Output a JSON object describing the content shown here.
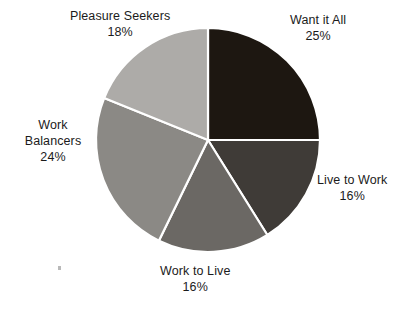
{
  "chart_data": {
    "type": "pie",
    "title": "",
    "subtitle": "",
    "xlabel": "",
    "ylabel": "",
    "legend_position": "labels-around-pie",
    "grid": false,
    "start_angle_deg": 0,
    "direction": "clockwise",
    "categories": [
      "Want it All",
      "Live to Work",
      "Work to Live",
      "Work Balancers",
      "Pleasure Seekers"
    ],
    "values": [
      25,
      16,
      16,
      24,
      18
    ],
    "value_suffix": "%",
    "colors": [
      "#1d1711",
      "#3f3b37",
      "#6b6864",
      "#8b8985",
      "#adaba8"
    ],
    "slice_border_color": "#ffffff",
    "background_color": "#ffffff",
    "slices": [
      {
        "label": "Want it All",
        "value": 25,
        "value_text": "25%",
        "color": "#1d1711",
        "start_deg": 0,
        "end_deg": 90
      },
      {
        "label": "Live to Work",
        "value": 16,
        "value_text": "16%",
        "color": "#3f3b37",
        "start_deg": 90,
        "end_deg": 148
      },
      {
        "label": "Work to Live",
        "value": 16,
        "value_text": "16%",
        "color": "#6b6864",
        "start_deg": 148,
        "end_deg": 206
      },
      {
        "label": "Work Balancers",
        "value": 24,
        "value_text": "24%",
        "color": "#8b8985",
        "start_deg": 206,
        "end_deg": 292
      },
      {
        "label": "Pleasure Seekers",
        "value": 18,
        "value_text": "18%",
        "color": "#adaba8",
        "start_deg": 292,
        "end_deg": 360
      }
    ]
  },
  "labels": {
    "want_it_all": {
      "name": "Want it All",
      "value": "25%"
    },
    "live_to_work": {
      "name": "Live to Work",
      "value": "16%"
    },
    "work_to_live": {
      "name": "Work to Live",
      "value": "16%"
    },
    "work_balancers": {
      "name": "Work Balancers",
      "value": "24%"
    },
    "pleasure_seekers": {
      "name": "Pleasure Seekers",
      "value": "18%"
    }
  }
}
